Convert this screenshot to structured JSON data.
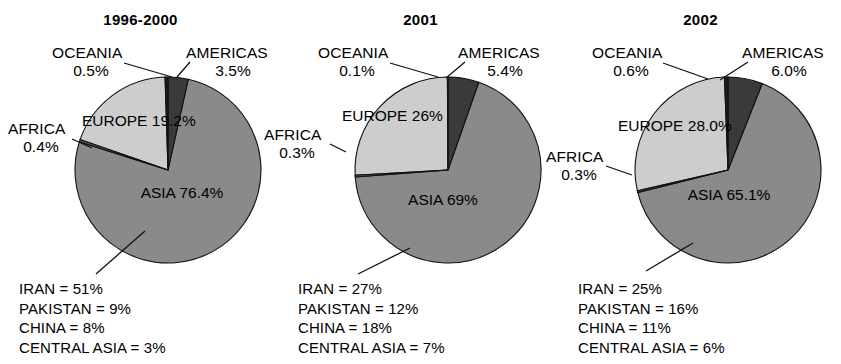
{
  "figure": {
    "width": 841,
    "height": 364,
    "background": "#ffffff"
  },
  "colors": {
    "asia": "#8a8a8a",
    "europe": "#cdcdcd",
    "americas": "#3a3a3a",
    "africa": "#545454",
    "oceania": "#1c1c1c",
    "outline": "#111111",
    "text": "#000000"
  },
  "chart_data": [
    {
      "type": "pie",
      "title": "1996-2000",
      "labels": [
        "ASIA",
        "EUROPE",
        "AMERICAS",
        "OCEANIA",
        "AFRICA"
      ],
      "values": [
        76.4,
        19.2,
        3.5,
        0.5,
        0.4
      ],
      "value_labels": [
        "76.4%",
        "19.2%",
        "3.5%",
        "0.5%",
        "0.4%"
      ],
      "legend_title": "",
      "sub_breakdown": [
        "IRAN = 51%",
        "PAKISTAN = 9%",
        "CHINA = 8%",
        "CENTRAL ASIA = 3%"
      ]
    },
    {
      "type": "pie",
      "title": "2001",
      "labels": [
        "ASIA",
        "EUROPE",
        "AMERICAS",
        "OCEANIA",
        "AFRICA"
      ],
      "values": [
        69,
        26,
        5.4,
        0.1,
        0.3
      ],
      "value_labels": [
        "69%",
        "26%",
        "5.4%",
        "0.1%",
        "0.3%"
      ],
      "legend_title": "",
      "sub_breakdown": [
        "IRAN = 27%",
        "PAKISTAN = 12%",
        "CHINA = 18%",
        "CENTRAL ASIA = 7%"
      ]
    },
    {
      "type": "pie",
      "title": "2002",
      "labels": [
        "ASIA",
        "EUROPE",
        "AMERICAS",
        "OCEANIA",
        "AFRICA"
      ],
      "values": [
        65.1,
        28.0,
        6.0,
        0.6,
        0.3
      ],
      "value_labels": [
        "65.1%",
        "28.0%",
        "6.0%",
        "0.6%",
        "0.3%"
      ],
      "legend_title": "",
      "sub_breakdown": [
        "IRAN = 25%",
        "PAKISTAN = 16%",
        "CHINA = 11%",
        "CENTRAL ASIA = 6%"
      ]
    }
  ]
}
